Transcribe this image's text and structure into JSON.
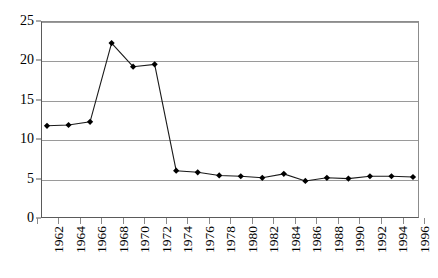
{
  "chart_data": {
    "type": "line",
    "title": "",
    "subtitle": "",
    "xlabel": "",
    "ylabel": "",
    "categories": [
      "1962",
      "1964",
      "1966",
      "1968",
      "1970",
      "1972",
      "1974",
      "1976",
      "1978",
      "1980",
      "1982",
      "1984",
      "1986",
      "1988",
      "1990",
      "1992",
      "1994",
      "1996"
    ],
    "values": [
      11.7,
      11.8,
      12.2,
      22.2,
      19.2,
      19.5,
      6.0,
      5.8,
      5.4,
      5.3,
      5.1,
      5.6,
      4.7,
      5.1,
      5.0,
      5.3,
      5.3,
      5.2
    ],
    "series": [
      {
        "name": "series-1",
        "values": [
          11.7,
          11.8,
          12.2,
          22.2,
          19.2,
          19.5,
          6.0,
          5.8,
          5.4,
          5.3,
          5.1,
          5.6,
          4.7,
          5.1,
          5.0,
          5.3,
          5.3,
          5.2
        ]
      }
    ],
    "ylim": [
      0,
      25
    ],
    "yticks": [
      0,
      5,
      10,
      15,
      20,
      25
    ],
    "ytick_labels": [
      "0",
      "5",
      "10",
      "15",
      "20",
      "25"
    ],
    "grid": true,
    "grid_axis": "y",
    "legend": false,
    "legend_position": "none",
    "marker": "diamond",
    "marker_color": "#000000",
    "line_color": "#1a1a1a",
    "grid_color": "#9a9a9a",
    "axis_color": "#5a5a5a",
    "background": "#ffffff",
    "xtick_label_rotation": 90
  }
}
